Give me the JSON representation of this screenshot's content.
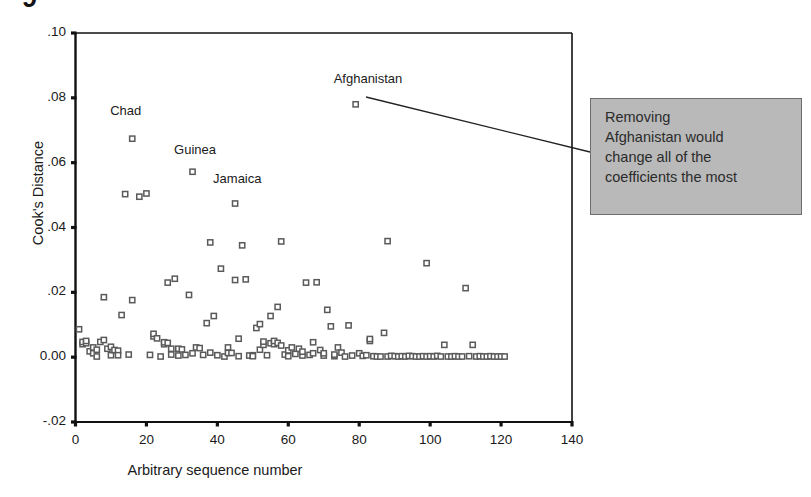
{
  "figure": {
    "caption_stub": "9",
    "annotation": {
      "lines": [
        "Removing",
        "Afghanistan would",
        "change all of the",
        "coefficients the most"
      ],
      "box_color": "#b9b9b9",
      "border_color": "#6e6e6e"
    },
    "leader_line": {
      "from_x": 366,
      "from_y": 97,
      "to_x": 590,
      "to_y": 152,
      "color": "#222222"
    }
  },
  "chart_data": {
    "type": "scatter",
    "title": "",
    "xlabel": "Arbitrary sequence number",
    "ylabel": "Cook's Distance",
    "xlim": [
      0,
      140
    ],
    "ylim": [
      -0.02,
      0.1
    ],
    "xticks": [
      0,
      20,
      40,
      60,
      80,
      100,
      120,
      140
    ],
    "xtick_labels": [
      "0",
      "20",
      "40",
      "60",
      "80",
      "100",
      "120",
      "140"
    ],
    "yticks": [
      -0.02,
      0.0,
      0.02,
      0.04,
      0.06,
      0.08,
      0.1
    ],
    "ytick_labels": [
      "-.02",
      "0.00",
      ".02",
      ".04",
      ".06",
      ".08",
      ".10"
    ],
    "grid": false,
    "legend": "none",
    "marker": "open-square",
    "marker_color": "#5a5a5a",
    "annotations": [
      {
        "text": "Chad",
        "x": 16,
        "y": 0.0755
      },
      {
        "text": "Guinea",
        "x": 34,
        "y": 0.0635
      },
      {
        "text": "Jamaica",
        "x": 45,
        "y": 0.0545
      },
      {
        "text": "Afghanistan",
        "x": 79,
        "y": 0.0855
      }
    ],
    "points": [
      {
        "x": 1,
        "y": 0.0086
      },
      {
        "x": 2,
        "y": 0.004
      },
      {
        "x": 2,
        "y": 0.0047
      },
      {
        "x": 3,
        "y": 0.0043
      },
      {
        "x": 3,
        "y": 0.005
      },
      {
        "x": 4,
        "y": 0.0018
      },
      {
        "x": 5,
        "y": 0.0012
      },
      {
        "x": 5,
        "y": 0.003
      },
      {
        "x": 6,
        "y": 0.0023
      },
      {
        "x": 6,
        "y": 0.0002
      },
      {
        "x": 7,
        "y": 0.0047
      },
      {
        "x": 8,
        "y": 0.0053
      },
      {
        "x": 8,
        "y": 0.0185
      },
      {
        "x": 9,
        "y": 0.0026
      },
      {
        "x": 10,
        "y": 0.0032
      },
      {
        "x": 10,
        "y": 0.0006
      },
      {
        "x": 11,
        "y": 0.0022
      },
      {
        "x": 12,
        "y": 0.002
      },
      {
        "x": 12,
        "y": 0.0006
      },
      {
        "x": 13,
        "y": 0.013
      },
      {
        "x": 14,
        "y": 0.0503
      },
      {
        "x": 15,
        "y": 0.0008
      },
      {
        "x": 16,
        "y": 0.0176
      },
      {
        "x": 16,
        "y": 0.0674
      },
      {
        "x": 18,
        "y": 0.0495
      },
      {
        "x": 20,
        "y": 0.0505
      },
      {
        "x": 21,
        "y": 0.0007
      },
      {
        "x": 22,
        "y": 0.0064
      },
      {
        "x": 22,
        "y": 0.0072
      },
      {
        "x": 23,
        "y": 0.0058
      },
      {
        "x": 24,
        "y": 0.0002
      },
      {
        "x": 25,
        "y": 0.004
      },
      {
        "x": 25,
        "y": 0.0046
      },
      {
        "x": 26,
        "y": 0.0044
      },
      {
        "x": 26,
        "y": 0.023
      },
      {
        "x": 27,
        "y": 0.0026
      },
      {
        "x": 27,
        "y": 0.0008
      },
      {
        "x": 28,
        "y": 0.0242
      },
      {
        "x": 29,
        "y": 0.0005
      },
      {
        "x": 29,
        "y": 0.0026
      },
      {
        "x": 30,
        "y": 0.0024
      },
      {
        "x": 31,
        "y": 0.0007
      },
      {
        "x": 32,
        "y": 0.0192
      },
      {
        "x": 33,
        "y": 0.0012
      },
      {
        "x": 33,
        "y": 0.0572
      },
      {
        "x": 34,
        "y": 0.003
      },
      {
        "x": 35,
        "y": 0.0028
      },
      {
        "x": 36,
        "y": 0.0007
      },
      {
        "x": 37,
        "y": 0.0105
      },
      {
        "x": 38,
        "y": 0.0014
      },
      {
        "x": 38,
        "y": 0.0354
      },
      {
        "x": 39,
        "y": 0.0127
      },
      {
        "x": 40,
        "y": 0.0006
      },
      {
        "x": 41,
        "y": 0.0273
      },
      {
        "x": 42,
        "y": 0.0002
      },
      {
        "x": 43,
        "y": 0.003
      },
      {
        "x": 43,
        "y": 0.0013
      },
      {
        "x": 44,
        "y": 0.0013
      },
      {
        "x": 45,
        "y": 0.0474
      },
      {
        "x": 45,
        "y": 0.0238
      },
      {
        "x": 46,
        "y": 0.0057
      },
      {
        "x": 46,
        "y": 0.0003
      },
      {
        "x": 47,
        "y": 0.0345
      },
      {
        "x": 48,
        "y": 0.024
      },
      {
        "x": 49,
        "y": 0.0005
      },
      {
        "x": 50,
        "y": 0.0006
      },
      {
        "x": 50,
        "y": 0.0003
      },
      {
        "x": 51,
        "y": 0.009
      },
      {
        "x": 52,
        "y": 0.0023
      },
      {
        "x": 52,
        "y": 0.0102
      },
      {
        "x": 53,
        "y": 0.0038
      },
      {
        "x": 53,
        "y": 0.0048
      },
      {
        "x": 54,
        "y": 0.0006
      },
      {
        "x": 55,
        "y": 0.0127
      },
      {
        "x": 55,
        "y": 0.0043
      },
      {
        "x": 56,
        "y": 0.004
      },
      {
        "x": 56,
        "y": 0.005
      },
      {
        "x": 57,
        "y": 0.0155
      },
      {
        "x": 57,
        "y": 0.0044
      },
      {
        "x": 58,
        "y": 0.0036
      },
      {
        "x": 58,
        "y": 0.0357
      },
      {
        "x": 59,
        "y": 0.0008
      },
      {
        "x": 60,
        "y": 0.0021
      },
      {
        "x": 60,
        "y": 0.0003
      },
      {
        "x": 61,
        "y": 0.003
      },
      {
        "x": 62,
        "y": 0.001
      },
      {
        "x": 63,
        "y": 0.0026
      },
      {
        "x": 64,
        "y": 0.0005
      },
      {
        "x": 64,
        "y": 0.0017
      },
      {
        "x": 65,
        "y": 0.023
      },
      {
        "x": 66,
        "y": 0.0007
      },
      {
        "x": 67,
        "y": 0.0046
      },
      {
        "x": 67,
        "y": 0.0012
      },
      {
        "x": 68,
        "y": 0.0231
      },
      {
        "x": 69,
        "y": 0.0022
      },
      {
        "x": 70,
        "y": 0.0005
      },
      {
        "x": 70,
        "y": 0.0012
      },
      {
        "x": 71,
        "y": 0.0146
      },
      {
        "x": 72,
        "y": 0.0095
      },
      {
        "x": 73,
        "y": 0.0003
      },
      {
        "x": 73,
        "y": 0.0008
      },
      {
        "x": 74,
        "y": 0.003
      },
      {
        "x": 75,
        "y": 0.0014
      },
      {
        "x": 76,
        "y": 0.0002
      },
      {
        "x": 77,
        "y": 0.0098
      },
      {
        "x": 78,
        "y": 0.0005
      },
      {
        "x": 79,
        "y": 0.078
      },
      {
        "x": 80,
        "y": 0.0012
      },
      {
        "x": 81,
        "y": 0.0004
      },
      {
        "x": 82,
        "y": 0.0006
      },
      {
        "x": 83,
        "y": 0.005
      },
      {
        "x": 83,
        "y": 0.0056
      },
      {
        "x": 84,
        "y": 0.0003
      },
      {
        "x": 85,
        "y": 0.0002
      },
      {
        "x": 86,
        "y": 0.0002
      },
      {
        "x": 87,
        "y": 0.0075
      },
      {
        "x": 88,
        "y": 0.0358
      },
      {
        "x": 88,
        "y": 0.0002
      },
      {
        "x": 89,
        "y": 0.0004
      },
      {
        "x": 90,
        "y": 0.0003
      },
      {
        "x": 91,
        "y": 0.0002
      },
      {
        "x": 92,
        "y": 0.0003
      },
      {
        "x": 93,
        "y": 0.0002
      },
      {
        "x": 94,
        "y": 0.0004
      },
      {
        "x": 95,
        "y": 0.0003
      },
      {
        "x": 96,
        "y": 0.0002
      },
      {
        "x": 97,
        "y": 0.0002
      },
      {
        "x": 98,
        "y": 0.0003
      },
      {
        "x": 99,
        "y": 0.029
      },
      {
        "x": 99,
        "y": 0.0002
      },
      {
        "x": 100,
        "y": 0.0003
      },
      {
        "x": 101,
        "y": 0.0002
      },
      {
        "x": 102,
        "y": 0.0004
      },
      {
        "x": 103,
        "y": 0.0002
      },
      {
        "x": 104,
        "y": 0.0038
      },
      {
        "x": 105,
        "y": 0.0002
      },
      {
        "x": 106,
        "y": 0.0002
      },
      {
        "x": 107,
        "y": 0.0003
      },
      {
        "x": 108,
        "y": 0.0002
      },
      {
        "x": 109,
        "y": 0.0002
      },
      {
        "x": 110,
        "y": 0.0213
      },
      {
        "x": 111,
        "y": 0.0003
      },
      {
        "x": 112,
        "y": 0.0038
      },
      {
        "x": 113,
        "y": 0.0002
      },
      {
        "x": 114,
        "y": 0.0003
      },
      {
        "x": 115,
        "y": 0.0002
      },
      {
        "x": 116,
        "y": 0.0002
      },
      {
        "x": 117,
        "y": 0.0003
      },
      {
        "x": 118,
        "y": 0.0002
      },
      {
        "x": 119,
        "y": 0.0002
      },
      {
        "x": 120,
        "y": 0.0002
      },
      {
        "x": 121,
        "y": 0.0002
      }
    ]
  }
}
